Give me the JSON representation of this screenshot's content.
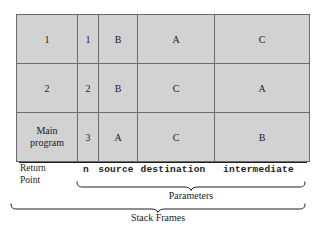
{
  "figure": {
    "title": "Stack Frames",
    "table": {
      "columns": [
        {
          "key": "return_point",
          "label_lines": [
            "Return",
            "Point"
          ]
        },
        {
          "key": "n",
          "label": "n"
        },
        {
          "key": "source",
          "label": "source"
        },
        {
          "key": "destination",
          "label": "destination"
        },
        {
          "key": "intermediate",
          "label": "intermediate"
        }
      ],
      "rows": [
        {
          "return_point": "1",
          "return_point_lines": [
            "1"
          ],
          "n": "1",
          "source": "B",
          "destination": "A",
          "intermediate": "C"
        },
        {
          "return_point": "2",
          "return_point_lines": [
            "2"
          ],
          "n": "2",
          "source": "B",
          "destination": "C",
          "intermediate": "A"
        },
        {
          "return_point": "Main program",
          "return_point_lines": [
            "Main",
            "program"
          ],
          "n": "3",
          "source": "A",
          "destination": "C",
          "intermediate": "B"
        }
      ]
    },
    "braces": [
      {
        "name": "parameters",
        "caption": "Parameters"
      },
      {
        "name": "stack-frames",
        "caption": "Stack Frames"
      }
    ],
    "colors": {
      "cell_fill": "#d2d2d2",
      "grid_line": "#6a6a6a",
      "border": "#5a5a5a",
      "shadow": "#1e1e1e",
      "text": "#1c1c1c",
      "page_background": "#ffffff"
    }
  }
}
